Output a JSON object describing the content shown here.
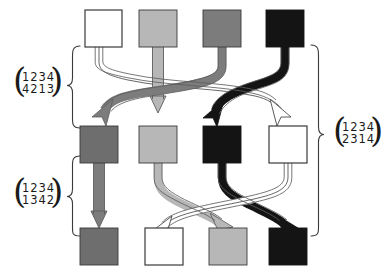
{
  "figure": {
    "type": "permutation-composition-diagram",
    "title": "",
    "rows": 3,
    "columns": 4,
    "palette": {
      "white": "#ffffff",
      "light_gray": "#b7b7b7",
      "medium_gray": "#7c7c7c",
      "dark_gray": "#6e6e6e",
      "black": "#141414",
      "outline": "#3a3a3a"
    },
    "node_rows": [
      {
        "row": "top",
        "nodes": [
          {
            "position": 1,
            "color_name": "white",
            "color": "#ffffff"
          },
          {
            "position": 2,
            "color_name": "light-gray",
            "color": "#b7b7b7"
          },
          {
            "position": 3,
            "color_name": "medium-gray",
            "color": "#7c7c7c"
          },
          {
            "position": 4,
            "color_name": "black",
            "color": "#141414"
          }
        ]
      },
      {
        "row": "middle",
        "nodes": [
          {
            "position": 1,
            "color_name": "medium-gray",
            "color": "#7c7c7c"
          },
          {
            "position": 2,
            "color_name": "light-gray",
            "color": "#b7b7b7"
          },
          {
            "position": 3,
            "color_name": "black",
            "color": "#141414"
          },
          {
            "position": 4,
            "color_name": "white",
            "color": "#ffffff"
          }
        ]
      },
      {
        "row": "bottom",
        "nodes": [
          {
            "position": 1,
            "color_name": "medium-gray",
            "color": "#7c7c7c"
          },
          {
            "position": 2,
            "color_name": "white",
            "color": "#ffffff"
          },
          {
            "position": 3,
            "color_name": "light-gray",
            "color": "#b7b7b7"
          },
          {
            "position": 4,
            "color_name": "black",
            "color": "#141414"
          }
        ]
      }
    ],
    "arrow_groups": [
      {
        "group": "top-to-middle",
        "permutation": "4213",
        "arrows": [
          {
            "from": 1,
            "to": 4,
            "color_name": "white",
            "color": "#ffffff"
          },
          {
            "from": 2,
            "to": 2,
            "color_name": "light-gray",
            "color": "#b7b7b7"
          },
          {
            "from": 3,
            "to": 1,
            "color_name": "medium-gray",
            "color": "#7c7c7c"
          },
          {
            "from": 4,
            "to": 3,
            "color_name": "black",
            "color": "#141414"
          }
        ]
      },
      {
        "group": "middle-to-bottom",
        "permutation": "1342",
        "arrows": [
          {
            "from": 1,
            "to": 1,
            "color_name": "medium-gray",
            "color": "#7c7c7c"
          },
          {
            "from": 2,
            "to": 3,
            "color_name": "light-gray",
            "color": "#b7b7b7"
          },
          {
            "from": 3,
            "to": 4,
            "color_name": "black",
            "color": "#141414"
          },
          {
            "from": 4,
            "to": 2,
            "color_name": "white",
            "color": "#ffffff"
          }
        ]
      }
    ],
    "labels": {
      "upper_left": {
        "top_row": "1234",
        "bottom_row": "4213",
        "notation": "two-line permutation",
        "brace_side": "right"
      },
      "lower_left": {
        "top_row": "1234",
        "bottom_row": "1342",
        "notation": "two-line permutation",
        "brace_side": "right"
      },
      "right": {
        "top_row": "1234",
        "bottom_row": "2314",
        "notation": "two-line permutation",
        "brace_side": "left"
      }
    }
  }
}
